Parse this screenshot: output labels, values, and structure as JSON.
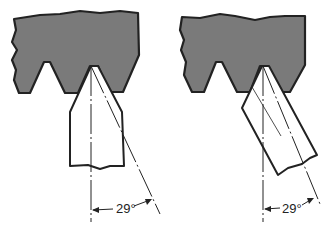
{
  "diagram": {
    "colors": {
      "workpiece_fill": "#7a7a7a",
      "outline": "#222222",
      "background": "#ffffff"
    },
    "views": [
      {
        "name": "tool-perpendicular",
        "angle_label": "29°"
      },
      {
        "name": "tool-inclined",
        "angle_label": "29°"
      }
    ]
  }
}
